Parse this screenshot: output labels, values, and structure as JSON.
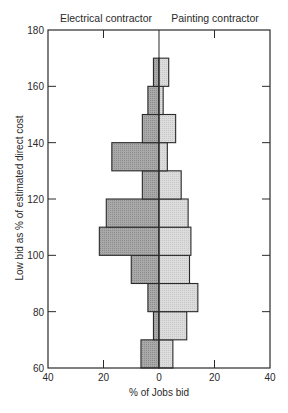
{
  "chart_data": {
    "type": "bar",
    "orientation": "horizontal",
    "layout": "back-to-back",
    "title": "",
    "xlabel": "% of Jobs bid",
    "ylabel": "Low bid as % of estimated direct cost",
    "xlim": [
      -40,
      40
    ],
    "ylim": [
      60,
      180
    ],
    "x_ticks": [
      -40,
      -20,
      0,
      20,
      40
    ],
    "x_tick_labels": [
      "40",
      "20",
      "0",
      "20",
      "40"
    ],
    "y_ticks": [
      60,
      80,
      100,
      120,
      140,
      160,
      180
    ],
    "y_tick_labels": [
      "60",
      "80",
      "100",
      "120",
      "140",
      "160",
      "180"
    ],
    "grid": false,
    "bins": [
      {
        "from": 60,
        "to": 70
      },
      {
        "from": 70,
        "to": 80
      },
      {
        "from": 80,
        "to": 90
      },
      {
        "from": 90,
        "to": 100
      },
      {
        "from": 100,
        "to": 110
      },
      {
        "from": 110,
        "to": 120
      },
      {
        "from": 120,
        "to": 130
      },
      {
        "from": 130,
        "to": 140
      },
      {
        "from": 140,
        "to": 150
      },
      {
        "from": 150,
        "to": 160
      },
      {
        "from": 160,
        "to": 170
      }
    ],
    "categories": [
      "60-70",
      "70-80",
      "80-90",
      "90-100",
      "100-110",
      "110-120",
      "120-130",
      "130-140",
      "140-150",
      "150-160",
      "160-170"
    ],
    "series": [
      {
        "name": "Electrical contractor",
        "side": "left",
        "color": "#a9a9a9",
        "values": [
          6.5,
          2,
          4,
          10,
          21.5,
          19,
          6,
          17,
          6,
          4,
          2
        ]
      },
      {
        "name": "Painting contractor",
        "side": "right",
        "color": "#dcdcdc",
        "values": [
          5,
          10,
          14,
          11,
          11.5,
          10.5,
          8,
          3,
          6,
          1.5,
          3.5
        ]
      }
    ],
    "legend": {
      "position": "top",
      "left_label": "Electrical contractor",
      "right_label": "Painting contractor"
    }
  }
}
